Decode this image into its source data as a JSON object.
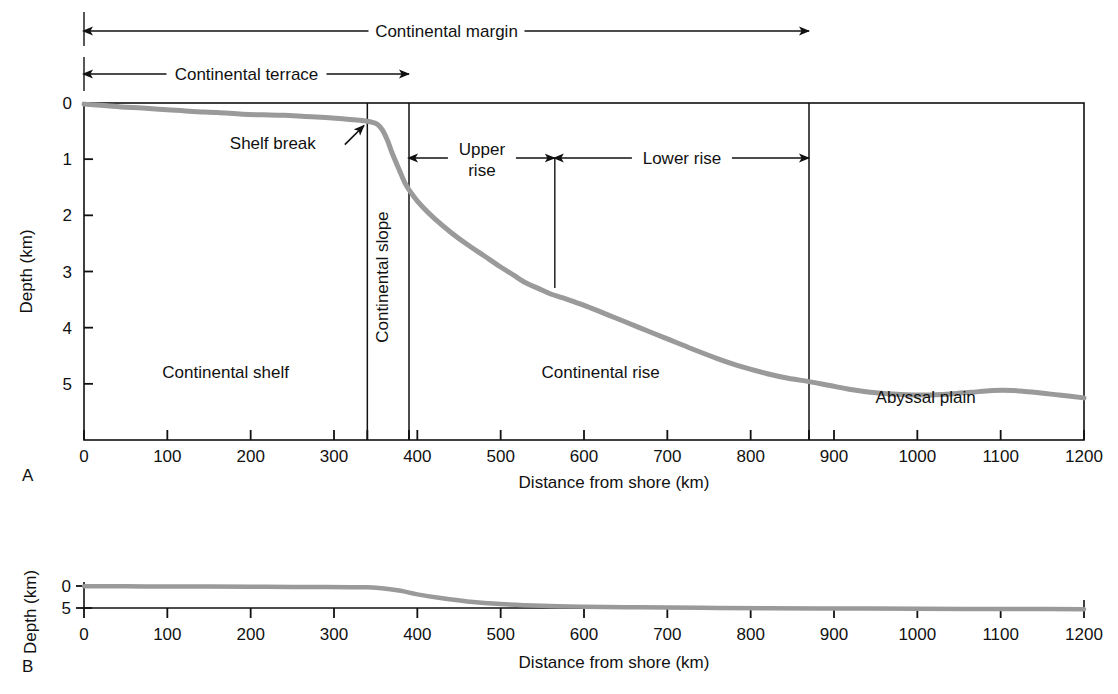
{
  "figure": {
    "panels": [
      {
        "id": "A",
        "letter": "A",
        "xlabel": "Distance from shore (km)",
        "ylabel": "Depth (km)"
      },
      {
        "id": "B",
        "letter": "B",
        "xlabel": "Distance from shore (km)",
        "ylabel": "Depth (km)"
      }
    ]
  },
  "brackets": [
    {
      "name": "continental-margin",
      "label": "Continental margin",
      "from_km": 0,
      "to_km": 870
    },
    {
      "name": "continental-terrace",
      "label": "Continental terrace",
      "from_km": 0,
      "to_km": 390
    },
    {
      "name": "upper-rise",
      "label": "Upper\nrise",
      "label_line1": "Upper",
      "label_line2": "rise",
      "from_km": 390,
      "to_km": 565
    },
    {
      "name": "lower-rise",
      "label": "Lower rise",
      "from_km": 565,
      "to_km": 870
    }
  ],
  "annotations": [
    {
      "name": "shelf-break",
      "label": "Shelf break",
      "target_km": 340,
      "target_depth_km": 0.34
    }
  ],
  "region_labels": [
    {
      "name": "continental-shelf",
      "label": "Continental shelf",
      "at_km": 170,
      "at_depth_km": 4.9,
      "orientation": "horizontal"
    },
    {
      "name": "continental-slope",
      "label": "Continental slope",
      "at_km": 365,
      "at_depth_km": 3.1,
      "orientation": "vertical"
    },
    {
      "name": "continental-rise",
      "label": "Continental rise",
      "at_km": 620,
      "at_depth_km": 4.9,
      "orientation": "horizontal"
    },
    {
      "name": "abyssal-plain",
      "label": "Abyssal plain",
      "at_km": 1010,
      "at_depth_km": 5.35,
      "orientation": "horizontal"
    }
  ],
  "colors": {
    "profile": "#9a9a9a",
    "axis": "#111111",
    "background": "#ffffff"
  },
  "chart_data": [
    {
      "type": "line",
      "panel": "A",
      "title": "",
      "xlabel": "Distance from shore (km)",
      "ylabel": "Depth (km)",
      "xlim": [
        0,
        1200
      ],
      "ylim": [
        0,
        6
      ],
      "y_inverted": true,
      "grid": false,
      "legend": "none",
      "xticks": [
        0,
        100,
        200,
        300,
        340,
        390,
        400,
        500,
        600,
        700,
        800,
        870,
        900,
        1000,
        1100,
        1200
      ],
      "xticklabels": [
        "0",
        "100",
        "200",
        "300",
        "",
        "",
        "400",
        "500",
        "600",
        "700",
        "800",
        "",
        "900",
        "1000",
        "1100",
        "1200"
      ],
      "yticks": [
        0,
        1,
        2,
        3,
        4,
        5
      ],
      "yticklabels": [
        "0",
        "1",
        "2",
        "3",
        "4",
        "5"
      ],
      "series": [
        {
          "name": "Seafloor profile (vertical exaggeration)",
          "x": [
            0,
            20,
            45,
            70,
            100,
            130,
            160,
            190,
            215,
            240,
            265,
            290,
            310,
            325,
            338,
            345,
            352,
            358,
            364,
            370,
            378,
            386,
            395,
            405,
            420,
            440,
            460,
            480,
            500,
            515,
            530,
            545,
            560,
            575,
            590,
            610,
            630,
            650,
            675,
            700,
            730,
            760,
            790,
            820,
            845,
            870,
            895,
            920,
            950,
            980,
            1010,
            1040,
            1065,
            1090,
            1115,
            1140,
            1170,
            1200
          ],
          "y": [
            0.02,
            0.04,
            0.07,
            0.09,
            0.12,
            0.15,
            0.17,
            0.2,
            0.21,
            0.22,
            0.24,
            0.26,
            0.28,
            0.3,
            0.32,
            0.34,
            0.38,
            0.48,
            0.66,
            0.9,
            1.18,
            1.45,
            1.65,
            1.83,
            2.05,
            2.3,
            2.52,
            2.72,
            2.92,
            3.06,
            3.2,
            3.3,
            3.4,
            3.47,
            3.55,
            3.66,
            3.78,
            3.9,
            4.05,
            4.2,
            4.38,
            4.55,
            4.7,
            4.82,
            4.9,
            4.96,
            5.03,
            5.1,
            5.16,
            5.19,
            5.2,
            5.18,
            5.15,
            5.12,
            5.12,
            5.15,
            5.2,
            5.25
          ]
        }
      ]
    },
    {
      "type": "line",
      "panel": "B",
      "title": "",
      "xlabel": "Distance from shore (km)",
      "ylabel": "Depth (km)",
      "xlim": [
        0,
        1200
      ],
      "ylim": [
        0,
        6
      ],
      "y_inverted": true,
      "grid": false,
      "legend": "none",
      "xticks": [
        0,
        100,
        200,
        300,
        400,
        500,
        600,
        700,
        800,
        900,
        1000,
        1100,
        1200
      ],
      "xticklabels": [
        "0",
        "100",
        "200",
        "300",
        "400",
        "500",
        "600",
        "700",
        "800",
        "900",
        "1000",
        "1100",
        "1200"
      ],
      "yticks": [
        0,
        5
      ],
      "yticklabels": [
        "0",
        "5"
      ],
      "series": [
        {
          "name": "Seafloor profile (true scale)",
          "x": [
            0,
            50,
            100,
            150,
            200,
            250,
            290,
            320,
            340,
            360,
            380,
            400,
            430,
            460,
            500,
            550,
            600,
            650,
            700,
            760,
            820,
            880,
            940,
            1000,
            1060,
            1120,
            1200
          ],
          "y": [
            0.05,
            0.08,
            0.11,
            0.14,
            0.17,
            0.2,
            0.23,
            0.26,
            0.3,
            0.55,
            1.1,
            1.9,
            2.8,
            3.5,
            4.1,
            4.5,
            4.7,
            4.82,
            4.9,
            4.98,
            5.04,
            5.09,
            5.13,
            5.17,
            5.2,
            5.23,
            5.26
          ]
        }
      ]
    }
  ]
}
